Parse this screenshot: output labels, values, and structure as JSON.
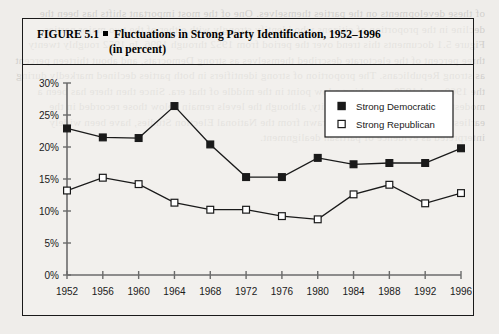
{
  "figure": {
    "label": "FIGURE 5.1",
    "title_line1": "Fluctuations in Strong Party Identification, 1952–1996",
    "title_line2": "(in percent)"
  },
  "legend": {
    "position": "top-right",
    "items": [
      {
        "label": "Strong Democratic",
        "marker": "filled-square",
        "color": "#1a1a1a"
      },
      {
        "label": "Strong Republican",
        "marker": "open-square",
        "color": "#ffffff"
      }
    ]
  },
  "bleed_text": "of these developments on the parties themselves. One of the most important shifts has been the decline in the proportion of citizens who identify strongly with either of the two major parties. Figure 5.1 documents this trend over the period from 1952 through 1996. In 1952 roughly twenty three percent of the electorate described themselves as strong Democrats, and about thirteen percent as strong Republicans. The proportion of strong identifiers in both parties declined markedly during the 1960s and 1970s, reaching a low point in the middle of that era. Since then there has been a modest recovery in partisan intensity, although the levels remain below those recorded in the earliest surveys. These patterns, drawn from the National Election Studies, have been widely interpreted as evidence of partisan dealignment.",
  "chart_data": {
    "type": "line",
    "title": "Fluctuations in Strong Party Identification, 1952–1996 (in percent)",
    "xlabel": "",
    "ylabel": "",
    "x": [
      1952,
      1956,
      1960,
      1964,
      1968,
      1972,
      1976,
      1980,
      1984,
      1988,
      1992,
      1996
    ],
    "categories": [
      "1952",
      "1956",
      "1960",
      "1964",
      "1968",
      "1972",
      "1976",
      "1980",
      "1984",
      "1988",
      "1992",
      "1996"
    ],
    "ylim": [
      0,
      30
    ],
    "yticks": [
      0,
      5,
      10,
      15,
      20,
      25,
      30
    ],
    "ytick_labels": [
      "0%",
      "5%",
      "10%",
      "15%",
      "20%",
      "25%",
      "30%"
    ],
    "grid": false,
    "legend_position": "top-right",
    "series": [
      {
        "name": "Strong Democratic",
        "marker": "filled-square",
        "values": [
          22.9,
          21.5,
          21.4,
          26.4,
          20.4,
          15.3,
          15.3,
          18.3,
          17.3,
          17.5,
          17.5,
          19.8
        ]
      },
      {
        "name": "Strong Republican",
        "marker": "open-square",
        "values": [
          13.2,
          15.2,
          14.2,
          11.3,
          10.2,
          10.2,
          9.2,
          8.7,
          12.6,
          14.1,
          11.2,
          12.8
        ]
      }
    ]
  }
}
